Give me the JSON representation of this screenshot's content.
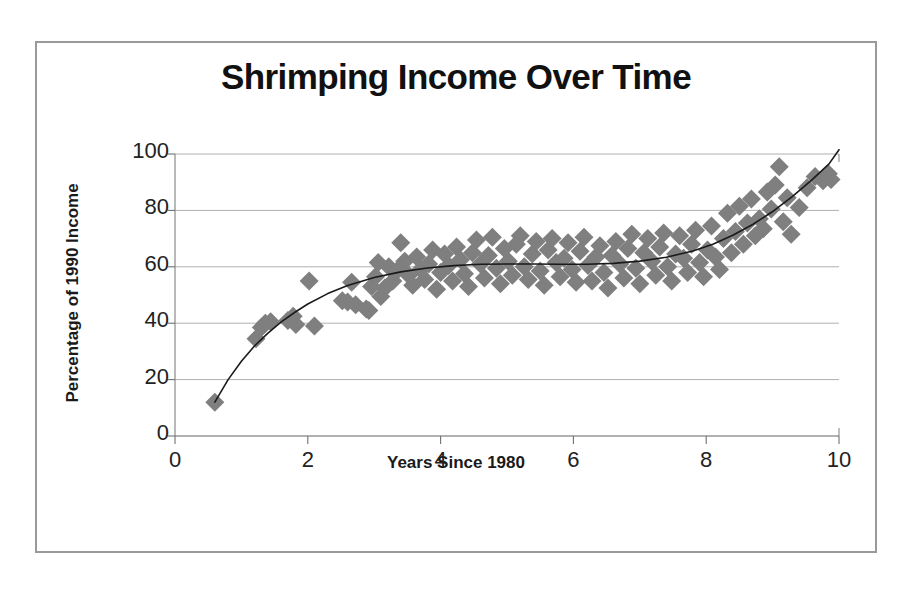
{
  "chart_data": {
    "type": "scatter",
    "title": "Shrimping Income Over Time",
    "xlabel": "Years Since 1980",
    "ylabel": "Percentage of 1990 Income",
    "xlim": [
      0,
      10
    ],
    "ylim": [
      0,
      100
    ],
    "xticks": [
      "0",
      "2",
      "4",
      "6",
      "8",
      "10"
    ],
    "yticks": [
      "0",
      "20",
      "40",
      "60",
      "80",
      "100"
    ],
    "grid": "horizontal",
    "legend": "none",
    "marker": "diamond",
    "marker_color": "#7f7f7f",
    "trend_color": "#1a1a1a",
    "background": "#ffffff",
    "border_color": "#9a9a9a",
    "series": [
      {
        "name": "Shrimping income",
        "points": [
          [
            0.6,
            12.0
          ],
          [
            1.22,
            34.5
          ],
          [
            1.3,
            38.5
          ],
          [
            1.36,
            40.0
          ],
          [
            1.44,
            40.5
          ],
          [
            1.7,
            41.0
          ],
          [
            1.78,
            42.5
          ],
          [
            1.82,
            39.5
          ],
          [
            2.02,
            55.0
          ],
          [
            2.1,
            39.0
          ],
          [
            2.52,
            48.0
          ],
          [
            2.6,
            47.5
          ],
          [
            2.66,
            54.5
          ],
          [
            2.72,
            46.5
          ],
          [
            2.88,
            45.0
          ],
          [
            2.92,
            44.5
          ],
          [
            2.96,
            53.0
          ],
          [
            3.02,
            56.5
          ],
          [
            3.06,
            61.5
          ],
          [
            3.1,
            49.5
          ],
          [
            3.16,
            52.5
          ],
          [
            3.22,
            60.0
          ],
          [
            3.28,
            55.0
          ],
          [
            3.34,
            58.5
          ],
          [
            3.4,
            68.5
          ],
          [
            3.46,
            62.0
          ],
          [
            3.52,
            57.0
          ],
          [
            3.58,
            53.5
          ],
          [
            3.64,
            63.5
          ],
          [
            3.7,
            59.0
          ],
          [
            3.76,
            55.5
          ],
          [
            3.82,
            61.0
          ],
          [
            3.88,
            66.0
          ],
          [
            3.94,
            52.0
          ],
          [
            4.0,
            58.0
          ],
          [
            4.06,
            64.5
          ],
          [
            4.12,
            60.5
          ],
          [
            4.18,
            55.0
          ],
          [
            4.24,
            67.0
          ],
          [
            4.3,
            62.5
          ],
          [
            4.36,
            57.5
          ],
          [
            4.42,
            53.0
          ],
          [
            4.48,
            65.0
          ],
          [
            4.54,
            69.5
          ],
          [
            4.6,
            61.0
          ],
          [
            4.66,
            56.0
          ],
          [
            4.72,
            64.0
          ],
          [
            4.78,
            70.5
          ],
          [
            4.84,
            59.5
          ],
          [
            4.9,
            54.0
          ],
          [
            4.96,
            66.5
          ],
          [
            5.02,
            62.0
          ],
          [
            5.08,
            57.0
          ],
          [
            5.14,
            68.0
          ],
          [
            5.2,
            71.0
          ],
          [
            5.26,
            60.0
          ],
          [
            5.32,
            55.5
          ],
          [
            5.38,
            64.5
          ],
          [
            5.44,
            69.0
          ],
          [
            5.5,
            58.5
          ],
          [
            5.56,
            53.5
          ],
          [
            5.62,
            66.0
          ],
          [
            5.68,
            70.0
          ],
          [
            5.74,
            61.5
          ],
          [
            5.8,
            56.5
          ],
          [
            5.86,
            63.0
          ],
          [
            5.92,
            68.5
          ],
          [
            5.98,
            59.0
          ],
          [
            6.04,
            54.5
          ],
          [
            6.1,
            65.5
          ],
          [
            6.16,
            70.5
          ],
          [
            6.22,
            60.5
          ],
          [
            6.28,
            55.0
          ],
          [
            6.34,
            63.5
          ],
          [
            6.4,
            67.5
          ],
          [
            6.46,
            58.0
          ],
          [
            6.52,
            52.5
          ],
          [
            6.58,
            64.0
          ],
          [
            6.64,
            69.0
          ],
          [
            6.7,
            61.0
          ],
          [
            6.76,
            56.0
          ],
          [
            6.82,
            66.5
          ],
          [
            6.88,
            71.5
          ],
          [
            6.94,
            59.5
          ],
          [
            7.0,
            54.0
          ],
          [
            7.06,
            65.0
          ],
          [
            7.12,
            70.0
          ],
          [
            7.18,
            62.0
          ],
          [
            7.24,
            57.0
          ],
          [
            7.3,
            67.0
          ],
          [
            7.36,
            72.0
          ],
          [
            7.42,
            60.0
          ],
          [
            7.48,
            55.0
          ],
          [
            7.54,
            64.5
          ],
          [
            7.6,
            71.0
          ],
          [
            7.66,
            63.0
          ],
          [
            7.72,
            58.0
          ],
          [
            7.78,
            68.0
          ],
          [
            7.84,
            73.0
          ],
          [
            7.9,
            61.5
          ],
          [
            7.96,
            56.5
          ],
          [
            8.02,
            66.0
          ],
          [
            8.08,
            74.5
          ],
          [
            8.14,
            63.5
          ],
          [
            8.2,
            59.0
          ],
          [
            8.26,
            70.0
          ],
          [
            8.32,
            79.0
          ],
          [
            8.38,
            65.0
          ],
          [
            8.44,
            72.5
          ],
          [
            8.5,
            81.5
          ],
          [
            8.56,
            68.0
          ],
          [
            8.62,
            75.5
          ],
          [
            8.68,
            84.0
          ],
          [
            8.74,
            71.0
          ],
          [
            8.8,
            77.0
          ],
          [
            8.86,
            73.5
          ],
          [
            8.92,
            86.5
          ],
          [
            8.98,
            80.5
          ],
          [
            9.04,
            89.0
          ],
          [
            9.1,
            95.5
          ],
          [
            9.16,
            76.0
          ],
          [
            9.22,
            84.5
          ],
          [
            9.28,
            71.5
          ],
          [
            9.4,
            81.0
          ],
          [
            9.52,
            88.0
          ],
          [
            9.64,
            92.0
          ],
          [
            9.76,
            90.5
          ],
          [
            9.84,
            93.0
          ],
          [
            9.88,
            91.0
          ]
        ]
      }
    ],
    "trend_curve": [
      [
        0.6,
        12.0
      ],
      [
        0.8,
        20.0
      ],
      [
        1.0,
        26.5
      ],
      [
        1.2,
        32.0
      ],
      [
        1.4,
        36.5
      ],
      [
        1.6,
        40.5
      ],
      [
        1.8,
        43.8
      ],
      [
        2.0,
        46.8
      ],
      [
        2.3,
        50.5
      ],
      [
        2.6,
        53.4
      ],
      [
        3.0,
        56.2
      ],
      [
        3.4,
        58.2
      ],
      [
        3.8,
        59.6
      ],
      [
        4.2,
        60.4
      ],
      [
        4.6,
        60.9
      ],
      [
        5.0,
        61.0
      ],
      [
        5.4,
        61.0
      ],
      [
        5.8,
        60.9
      ],
      [
        6.2,
        60.9
      ],
      [
        6.6,
        61.2
      ],
      [
        7.0,
        62.0
      ],
      [
        7.4,
        63.4
      ],
      [
        7.8,
        65.6
      ],
      [
        8.1,
        68.0
      ],
      [
        8.4,
        71.2
      ],
      [
        8.7,
        75.0
      ],
      [
        9.0,
        79.6
      ],
      [
        9.3,
        85.0
      ],
      [
        9.6,
        91.0
      ],
      [
        9.85,
        96.5
      ],
      [
        10.0,
        101.5
      ]
    ]
  }
}
